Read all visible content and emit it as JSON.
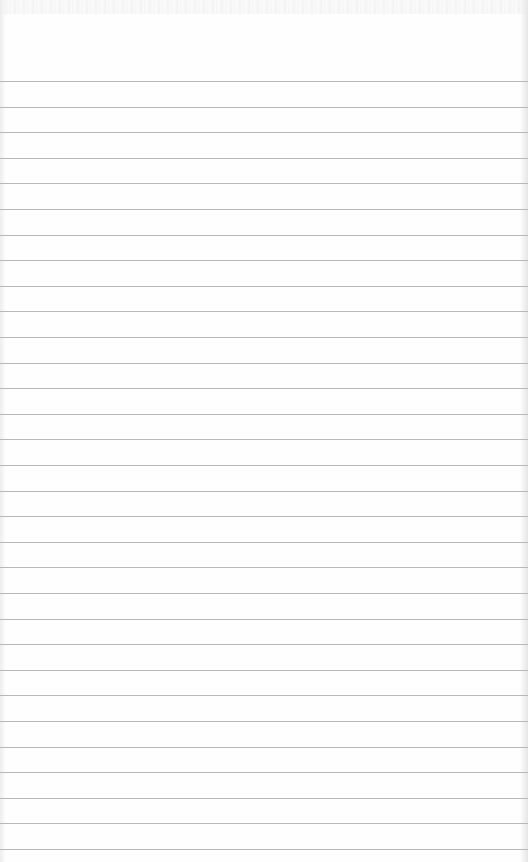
{
  "page": {
    "type": "lined-notepaper",
    "background_color": "#fefefe",
    "line_color": "#b8b8b8",
    "first_line_y": 81,
    "line_spacing": 25.6,
    "line_count": 31
  }
}
